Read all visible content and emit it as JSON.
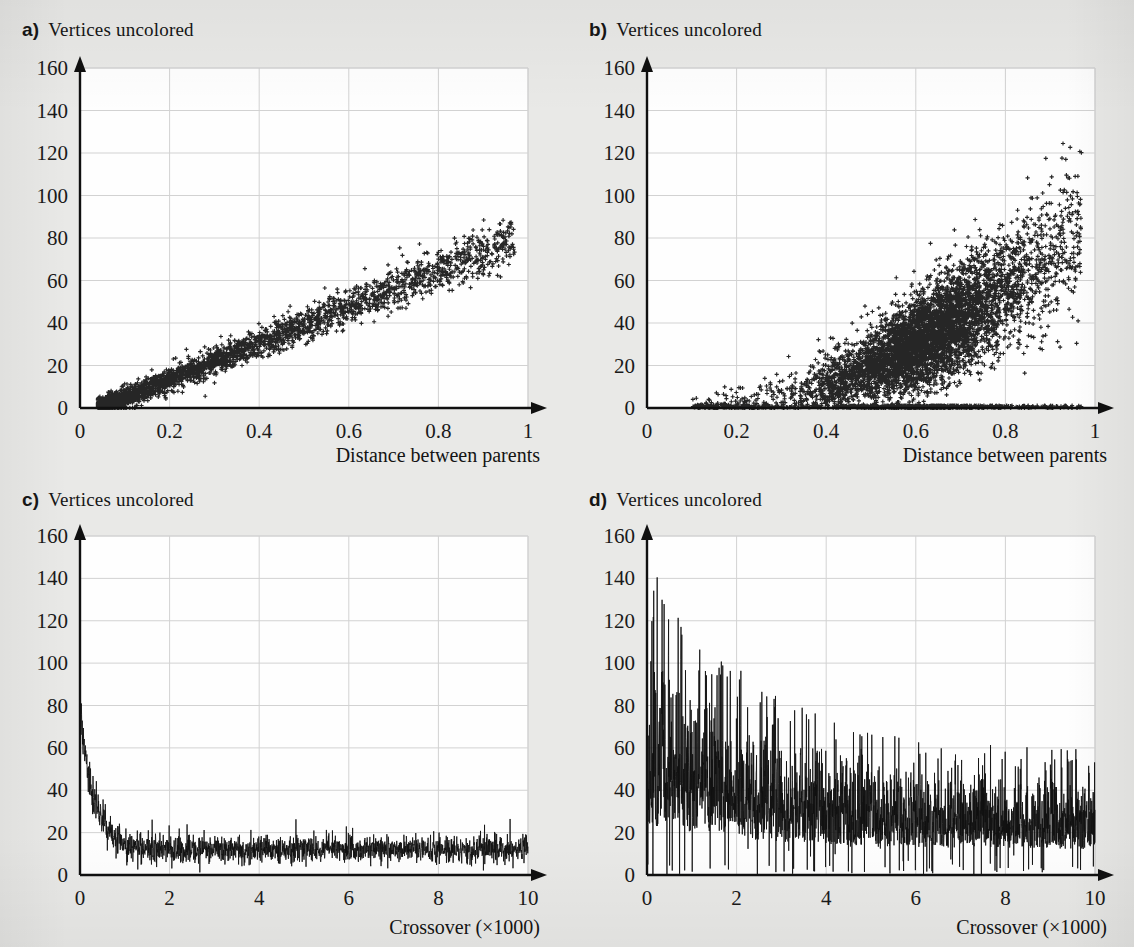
{
  "figure": {
    "background_color": "#e9e9e7",
    "plot_background_color": "#fefefe",
    "grid_color": "#d2d2d2",
    "axis_color": "#101010",
    "marker_color": "#262626",
    "line_color": "#111111"
  },
  "panels": {
    "a": {
      "letter": "a)",
      "caption": "Vertices uncolored"
    },
    "b": {
      "letter": "b)",
      "caption": "Vertices uncolored"
    },
    "c": {
      "letter": "c)",
      "caption": "Vertices uncolored"
    },
    "d": {
      "letter": "d)",
      "caption": "Vertices uncolored"
    }
  },
  "chart_data": [
    {
      "id": "a",
      "type": "scatter",
      "title": "Vertices uncolored",
      "panel_label": "a)",
      "xlabel": "Distance between parents",
      "ylabel": "Vertices uncolored",
      "xlim": [
        0,
        1
      ],
      "ylim": [
        0,
        160
      ],
      "xticks": [
        0,
        0.2,
        0.4,
        0.6,
        0.8,
        1
      ],
      "xticklabels": [
        "0",
        "0.2",
        "0.4",
        "0.6",
        "0.8",
        "1"
      ],
      "yticks": [
        0,
        20,
        40,
        60,
        80,
        100,
        120,
        140,
        160
      ],
      "yticklabels": [
        "0",
        "20",
        "40",
        "60",
        "80",
        "100",
        "120",
        "140",
        "160"
      ],
      "grid": true,
      "legend": "none",
      "marker": "plus",
      "n_points": 3000,
      "description": "Tight, nearly linear positive correlation; vertices uncolored rises from ~2 at distance 0.05 to ~78 at distance 0.95. Scatter band widens modestly with distance.",
      "trend": {
        "form": "linear",
        "intercept": -4,
        "slope": 86,
        "noise_sd_min": 2.0,
        "noise_sd_max": 6.0
      },
      "x_range_observed": [
        0.04,
        0.97
      ],
      "y_range_observed": [
        0,
        88
      ],
      "seed": 20240117,
      "reference_points": [
        {
          "x": 0.05,
          "y": 3
        },
        {
          "x": 0.1,
          "y": 9
        },
        {
          "x": 0.15,
          "y": 12
        },
        {
          "x": 0.2,
          "y": 16
        },
        {
          "x": 0.25,
          "y": 20
        },
        {
          "x": 0.3,
          "y": 24
        },
        {
          "x": 0.4,
          "y": 30
        },
        {
          "x": 0.5,
          "y": 38
        },
        {
          "x": 0.6,
          "y": 45
        },
        {
          "x": 0.7,
          "y": 54
        },
        {
          "x": 0.8,
          "y": 62
        },
        {
          "x": 0.9,
          "y": 70
        },
        {
          "x": 0.95,
          "y": 78
        }
      ]
    },
    {
      "id": "b",
      "type": "scatter",
      "title": "Vertices uncolored",
      "panel_label": "b)",
      "xlabel": "Distance between parents",
      "ylabel": "Vertices uncolored",
      "xlim": [
        0,
        1
      ],
      "ylim": [
        0,
        160
      ],
      "xticks": [
        0,
        0.2,
        0.4,
        0.6,
        0.8,
        1
      ],
      "xticklabels": [
        "0",
        "0.2",
        "0.4",
        "0.6",
        "0.8",
        "1"
      ],
      "yticks": [
        0,
        20,
        40,
        60,
        80,
        100,
        120,
        140,
        160
      ],
      "yticklabels": [
        "0",
        "20",
        "40",
        "60",
        "80",
        "100",
        "120",
        "140",
        "160"
      ],
      "grid": true,
      "legend": "none",
      "marker": "plus",
      "n_points": 6500,
      "description": "Broad fan-shaped positive relation with very large spread; dense core from distance 0.35-0.8 between 10 and 60, upper envelope reaching ~158 near distance 0.95, plus a dense band of zeros along the x axis from 0.45 onward.",
      "trend": {
        "form": "powerlaw",
        "coefficient": 95,
        "exponent": 1.9,
        "noise_sd_min": 6.0,
        "noise_sd_max": 34.0
      },
      "x_range_observed": [
        0.1,
        0.97
      ],
      "y_range_observed": [
        0,
        158
      ],
      "zero_band_fraction": 0.12,
      "seed": 771103,
      "reference_points": [
        {
          "x": 0.1,
          "y": 9
        },
        {
          "x": 0.2,
          "y": 10
        },
        {
          "x": 0.3,
          "y": 16
        },
        {
          "x": 0.4,
          "y": 26
        },
        {
          "x": 0.5,
          "y": 33
        },
        {
          "x": 0.6,
          "y": 42
        },
        {
          "x": 0.7,
          "y": 56
        },
        {
          "x": 0.8,
          "y": 78
        },
        {
          "x": 0.9,
          "y": 104
        },
        {
          "x": 0.95,
          "y": 120
        }
      ]
    },
    {
      "id": "c",
      "type": "line",
      "title": "Vertices uncolored",
      "panel_label": "c)",
      "xlabel": "Crossover (×1000)",
      "ylabel": "Vertices uncolored",
      "xlim": [
        0,
        10
      ],
      "ylim": [
        0,
        160
      ],
      "xticks": [
        0,
        2,
        4,
        6,
        8,
        10
      ],
      "xticklabels": [
        "0",
        "2",
        "4",
        "6",
        "8",
        "10"
      ],
      "yticks": [
        0,
        20,
        40,
        60,
        80,
        100,
        120,
        140,
        160
      ],
      "yticklabels": [
        "0",
        "20",
        "40",
        "60",
        "80",
        "100",
        "120",
        "140",
        "160"
      ],
      "grid": true,
      "legend": "none",
      "description": "Noisy trace starting at ~75 at crossover 0, decaying steeply to a stationary noise band centred near 12 by crossover 1.2, then flat with amplitude roughly 4-22 for the rest of the run.",
      "decay": {
        "start_value": 75,
        "asymptote": 12,
        "time_constant": 0.33
      },
      "noise_amplitude": 5.5,
      "n_samples": 2000,
      "seed": 424242,
      "reference_points": [
        {
          "x": 0.0,
          "y": 75
        },
        {
          "x": 0.2,
          "y": 52
        },
        {
          "x": 0.4,
          "y": 34
        },
        {
          "x": 0.6,
          "y": 24
        },
        {
          "x": 0.8,
          "y": 18
        },
        {
          "x": 1.0,
          "y": 15
        },
        {
          "x": 1.5,
          "y": 13
        },
        {
          "x": 2.0,
          "y": 13
        },
        {
          "x": 4.0,
          "y": 12
        },
        {
          "x": 6.0,
          "y": 12
        },
        {
          "x": 8.0,
          "y": 13
        },
        {
          "x": 10.0,
          "y": 13
        }
      ]
    },
    {
      "id": "d",
      "type": "line",
      "title": "Vertices uncolored",
      "panel_label": "d)",
      "xlabel": "Crossover (×1000)",
      "ylabel": "Vertices uncolored",
      "xlim": [
        0,
        10
      ],
      "ylim": [
        0,
        160
      ],
      "xticks": [
        0,
        2,
        4,
        6,
        8,
        10
      ],
      "xticklabels": [
        "0",
        "2",
        "4",
        "6",
        "8",
        "10"
      ],
      "yticks": [
        0,
        20,
        40,
        60,
        80,
        100,
        120,
        140,
        160
      ],
      "yticklabels": [
        "0",
        "20",
        "40",
        "60",
        "80",
        "100",
        "120",
        "140",
        "160"
      ],
      "grid": true,
      "legend": "none",
      "description": "Very high amplitude noise band. Peaks reach ~150 near crossover 0-0.3, the upper envelope falls to ~80 by crossover 3 and ~60 beyond crossover 6, while the trace still drops close to 0 throughout. Mean level declines from ~60 to ~30.",
      "decay": {
        "start_value": 60,
        "asymptote": 30,
        "time_constant": 2.6
      },
      "envelope": {
        "start_value": 150,
        "asymptote": 58,
        "time_constant": 2.4
      },
      "noise_amplitude": 30,
      "n_samples": 2200,
      "seed": 98765,
      "reference_points": [
        {
          "x": 0.0,
          "y": 150
        },
        {
          "x": 0.5,
          "y": 120
        },
        {
          "x": 1.0,
          "y": 110
        },
        {
          "x": 2.0,
          "y": 95
        },
        {
          "x": 3.0,
          "y": 80
        },
        {
          "x": 4.0,
          "y": 72
        },
        {
          "x": 5.0,
          "y": 70
        },
        {
          "x": 6.0,
          "y": 60
        },
        {
          "x": 7.0,
          "y": 58
        },
        {
          "x": 8.0,
          "y": 60
        },
        {
          "x": 9.0,
          "y": 65
        },
        {
          "x": 10.0,
          "y": 56
        }
      ]
    }
  ]
}
